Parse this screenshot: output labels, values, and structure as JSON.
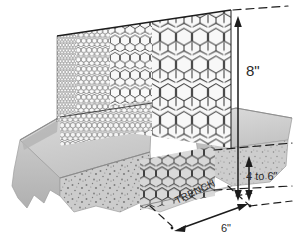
{
  "figure": {
    "type": "technical-illustration-perspective-cutaway"
  },
  "dimensions": {
    "above_ground_height": "8\"",
    "trench_depth": "4 to 6\"",
    "trench_width": "6\"",
    "trench_label": "TRENCH"
  },
  "annotations": [
    {
      "name": "height-dimension",
      "text": "8\"",
      "orientation": "vertical",
      "arrow": "double-headed",
      "measures": "total fence height above ground"
    },
    {
      "name": "depth-dimension",
      "text": "4 to 6\"",
      "orientation": "vertical",
      "arrow": "double-headed",
      "measures": "trench depth below grade"
    },
    {
      "name": "width-dimension",
      "text": "6\"",
      "orientation": "diagonal",
      "arrow": "double-headed",
      "measures": "trench width"
    },
    {
      "name": "trench-callout",
      "text": "TRENCH",
      "orientation": "diagonal",
      "measures": "trench location callout"
    }
  ],
  "colors": {
    "soil_top": "#cfcfcf",
    "soil_face": "#c2c2c2",
    "soil_shadow": "#a9a9a9",
    "soil_speckle": "#8a8a8a",
    "mesh_wire": "#3d3d3d",
    "mesh_fill": "#f6f6f6",
    "line": "#1c1c1c",
    "label_text": "#2a2a2a",
    "background": "#ffffff"
  },
  "mesh": {
    "pattern": "hexagonal",
    "description": "chicken-wire hexagonal mesh panel rendered in perspective, compressing toward the left vanishing point",
    "buried_portion": "mesh continues below grade into the trench"
  }
}
